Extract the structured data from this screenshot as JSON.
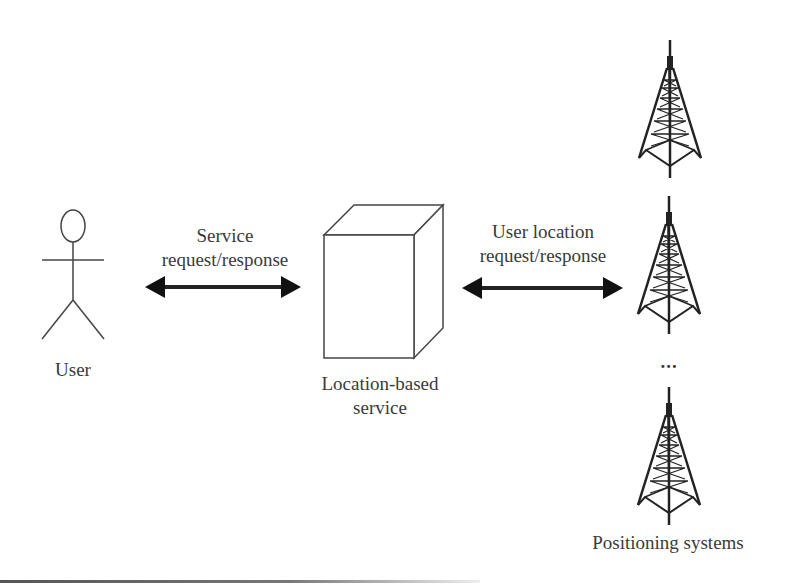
{
  "diagram": {
    "user": {
      "label": "User",
      "icon": "stick-figure-icon"
    },
    "service": {
      "label_line1": "Location-based",
      "label_line2": "service",
      "icon": "server-box-icon"
    },
    "arrow_left": {
      "label_line1": "Service",
      "label_line2": "request/response",
      "icon": "double-arrow-icon"
    },
    "arrow_right": {
      "label_line1": "User location",
      "label_line2": "request/response",
      "icon": "double-arrow-icon"
    },
    "positioning": {
      "label": "Positioning systems",
      "icon": "radio-tower-icon",
      "ellipsis": "..."
    },
    "colors": {
      "stroke": "#333333",
      "background": "#ffffff"
    }
  }
}
